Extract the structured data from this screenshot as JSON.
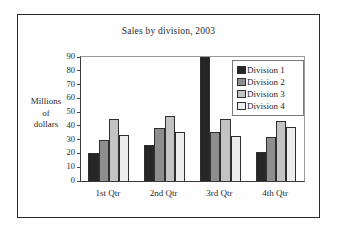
{
  "chart_data": {
    "type": "bar",
    "title": "Sales by division, 2003",
    "xlabel": "",
    "ylabel": "Millions of dollars",
    "ylabel_lines": [
      "Millions",
      "of",
      "dollars"
    ],
    "categories": [
      "1st Qtr",
      "2nd Qtr",
      "3rd Qtr",
      "4th Qtr"
    ],
    "series": [
      {
        "name": "Division 1",
        "color": "#262626",
        "values": [
          20.5,
          26.5,
          90,
          21
        ]
      },
      {
        "name": "Division 2",
        "color": "#8e8e8e",
        "values": [
          30,
          38.5,
          35.5,
          32
        ]
      },
      {
        "name": "Division 3",
        "color": "#c3c3c3",
        "values": [
          45,
          47,
          45,
          43.5
        ]
      },
      {
        "name": "Division 4",
        "color": "#ededed",
        "values": [
          33.5,
          35.5,
          32.5,
          39
        ]
      }
    ],
    "ylim": [
      0,
      90
    ],
    "ytick_labels": [
      "0",
      "10",
      "20",
      "30",
      "40",
      "50",
      "60",
      "70",
      "80",
      "90"
    ],
    "ytick_values": [
      0,
      10,
      20,
      30,
      40,
      50,
      60,
      70,
      80,
      90
    ],
    "grid": false,
    "legend_position": "upper right"
  }
}
